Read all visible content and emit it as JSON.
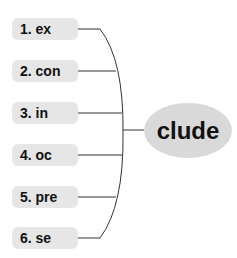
{
  "diagram": {
    "prefixes": [
      {
        "label": "1. ex"
      },
      {
        "label": "2. con"
      },
      {
        "label": "3. in"
      },
      {
        "label": "4. oc"
      },
      {
        "label": "5. pre"
      },
      {
        "label": "6. se"
      }
    ],
    "root": {
      "label": "clude"
    },
    "colors": {
      "box": "#e6e6e6",
      "ellipse": "#d9d9d9",
      "line": "#333333"
    }
  }
}
